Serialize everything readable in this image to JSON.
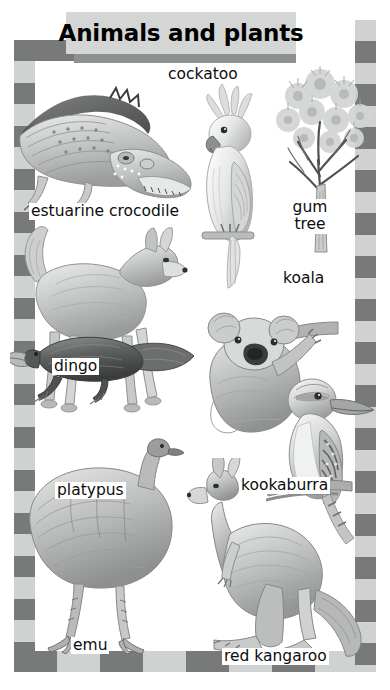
{
  "page": {
    "title": "Animals and plants",
    "background_color": "#ffffff",
    "frame_dark_color": "#777a79",
    "frame_light_color": "#d0d2d1",
    "banner_color": "#d4d6d5",
    "banner_shadow_color": "#8d908f",
    "text_color": "#0d0d0d"
  },
  "header": {
    "title": "Animals and plants"
  },
  "illustrations": [
    {
      "id": "crocodile",
      "name": "estuarine-crocodile-illustration",
      "caption": "estuarine crocodile"
    },
    {
      "id": "cockatoo",
      "name": "cockatoo-illustration",
      "caption": "cockatoo"
    },
    {
      "id": "gumtree",
      "name": "gum-tree-illustration",
      "caption": "gum tree"
    },
    {
      "id": "dingo",
      "name": "dingo-illustration",
      "caption": "dingo"
    },
    {
      "id": "koala",
      "name": "koala-illustration",
      "caption": "koala"
    },
    {
      "id": "kookaburra",
      "name": "kookaburra-illustration",
      "caption": "kookaburra"
    },
    {
      "id": "platypus",
      "name": "platypus-illustration",
      "caption": "platypus"
    },
    {
      "id": "emu",
      "name": "emu-illustration",
      "caption": "emu"
    },
    {
      "id": "redkangaroo",
      "name": "red-kangaroo-illustration",
      "caption": "red kangaroo"
    }
  ],
  "labels": {
    "cockatoo": "cockatoo",
    "crocodile": "estuarine crocodile",
    "gumtree_line1": "gum",
    "gumtree_line2": "tree",
    "koala": "koala",
    "dingo": "dingo",
    "kookaburra": "kookaburra",
    "platypus": "platypus",
    "emu": "emu",
    "redkangaroo": "red kangaroo"
  }
}
